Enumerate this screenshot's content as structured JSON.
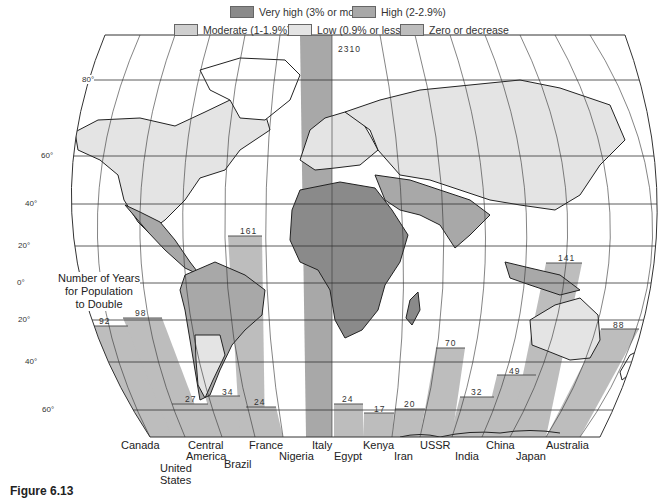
{
  "legend": {
    "items": [
      {
        "label": "Very high (3% or more)",
        "color": "#8a8a8a"
      },
      {
        "label": "High (2-2.9%)",
        "color": "#a8a8a8"
      },
      {
        "label": "Moderate (1-1.9%)",
        "color": "#cfcfcf"
      },
      {
        "label": "Low (0.9% or less)",
        "color": "#e4e4e4"
      },
      {
        "label": "Zero or decrease",
        "color": "#bdbdbd"
      }
    ]
  },
  "annotation": {
    "line1": "Number of Years",
    "line2": "for Population",
    "line3": "to Double"
  },
  "latitudes": [
    "80°",
    "60°",
    "40°",
    "20°",
    "0°",
    "20°",
    "40°",
    "60°"
  ],
  "bars": [
    {
      "country": "Canada",
      "years": "92"
    },
    {
      "country": "United States",
      "years": "98"
    },
    {
      "country": "Central America",
      "years": "27"
    },
    {
      "country": "Brazil",
      "years": "34"
    },
    {
      "country": "France",
      "years": "161"
    },
    {
      "country": "Nigeria",
      "years": "24"
    },
    {
      "country": "Italy",
      "years": "2310"
    },
    {
      "country": "Egypt",
      "years": "24"
    },
    {
      "country": "Kenya",
      "years": "17"
    },
    {
      "country": "Iran",
      "years": "20"
    },
    {
      "country": "USSR",
      "years": "70"
    },
    {
      "country": "India",
      "years": "32"
    },
    {
      "country": "China",
      "years": "49"
    },
    {
      "country": "Japan",
      "years": "141"
    },
    {
      "country": "Australia",
      "years": "88"
    }
  ],
  "country_labels": {
    "canada": "Canada",
    "us1": "United",
    "us2": "States",
    "ca1": "Central",
    "ca2": "America",
    "brazil": "Brazil",
    "france": "France",
    "nigeria": "Nigeria",
    "italy": "Italy",
    "egypt": "Egypt",
    "kenya": "Kenya",
    "iran": "Iran",
    "ussr": "USSR",
    "india": "India",
    "china": "China",
    "japan": "Japan",
    "australia": "Australia"
  },
  "caption": "Figure 6.13"
}
